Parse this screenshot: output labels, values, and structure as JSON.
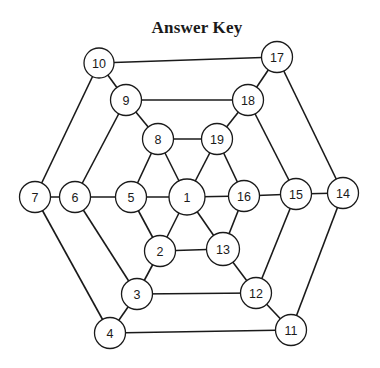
{
  "title": "Answer Key",
  "colors": {
    "stroke": "#1a1a1a",
    "node_fill": "#ffffff",
    "background": "#ffffff"
  },
  "graph": {
    "nodes": [
      {
        "id": "1",
        "label": "1",
        "x": 187,
        "y": 197,
        "r": 18
      },
      {
        "id": "2",
        "label": "2",
        "x": 160,
        "y": 251,
        "r": 15.5
      },
      {
        "id": "3",
        "label": "3",
        "x": 137,
        "y": 294,
        "r": 15.5
      },
      {
        "id": "4",
        "label": "4",
        "x": 110,
        "y": 333,
        "r": 15.5
      },
      {
        "id": "5",
        "label": "5",
        "x": 131,
        "y": 197,
        "r": 15.5
      },
      {
        "id": "6",
        "label": "6",
        "x": 75,
        "y": 197,
        "r": 15.5
      },
      {
        "id": "7",
        "label": "7",
        "x": 35,
        "y": 197,
        "r": 15.5
      },
      {
        "id": "8",
        "label": "8",
        "x": 158,
        "y": 139,
        "r": 15.5
      },
      {
        "id": "9",
        "label": "9",
        "x": 126,
        "y": 100,
        "r": 15.5
      },
      {
        "id": "10",
        "label": "10",
        "x": 99,
        "y": 63,
        "r": 15
      },
      {
        "id": "11",
        "label": "11",
        "x": 291,
        "y": 330,
        "r": 15.5
      },
      {
        "id": "12",
        "label": "12",
        "x": 256,
        "y": 293,
        "r": 15.5
      },
      {
        "id": "13",
        "label": "13",
        "x": 223,
        "y": 249,
        "r": 16.5
      },
      {
        "id": "14",
        "label": "14",
        "x": 343,
        "y": 193,
        "r": 15.5
      },
      {
        "id": "15",
        "label": "15",
        "x": 296,
        "y": 194,
        "r": 15.5
      },
      {
        "id": "16",
        "label": "16",
        "x": 244,
        "y": 196,
        "r": 15.5
      },
      {
        "id": "17",
        "label": "17",
        "x": 277,
        "y": 57,
        "r": 15.5
      },
      {
        "id": "18",
        "label": "18",
        "x": 248,
        "y": 100,
        "r": 15.5
      },
      {
        "id": "19",
        "label": "19",
        "x": 217,
        "y": 139,
        "r": 15.5
      }
    ],
    "edges": [
      [
        "10",
        "17"
      ],
      [
        "10",
        "9"
      ],
      [
        "10",
        "7"
      ],
      [
        "17",
        "18"
      ],
      [
        "17",
        "14"
      ],
      [
        "9",
        "18"
      ],
      [
        "9",
        "8"
      ],
      [
        "9",
        "6"
      ],
      [
        "18",
        "19"
      ],
      [
        "18",
        "15"
      ],
      [
        "8",
        "19"
      ],
      [
        "8",
        "5"
      ],
      [
        "8",
        "1"
      ],
      [
        "19",
        "1"
      ],
      [
        "19",
        "16"
      ],
      [
        "7",
        "6"
      ],
      [
        "6",
        "5"
      ],
      [
        "5",
        "1"
      ],
      [
        "1",
        "16"
      ],
      [
        "16",
        "15"
      ],
      [
        "15",
        "14"
      ],
      [
        "7",
        "4"
      ],
      [
        "6",
        "3"
      ],
      [
        "5",
        "2"
      ],
      [
        "1",
        "2"
      ],
      [
        "1",
        "13"
      ],
      [
        "16",
        "13"
      ],
      [
        "15",
        "12"
      ],
      [
        "14",
        "11"
      ],
      [
        "2",
        "13"
      ],
      [
        "2",
        "3"
      ],
      [
        "13",
        "12"
      ],
      [
        "3",
        "12"
      ],
      [
        "3",
        "4"
      ],
      [
        "12",
        "11"
      ],
      [
        "4",
        "11"
      ]
    ]
  }
}
